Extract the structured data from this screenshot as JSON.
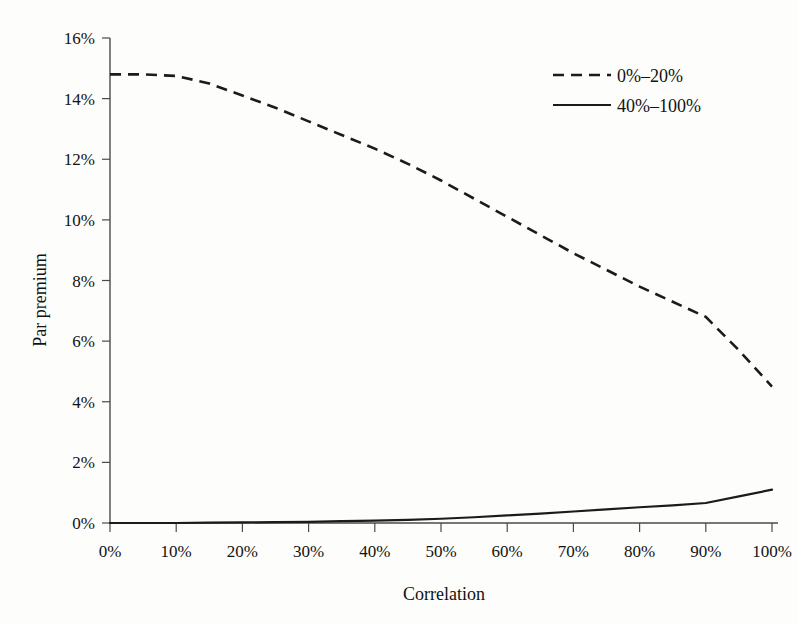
{
  "figure": {
    "background_color": "#fdfdfb",
    "ink_color": "#1b1b1b",
    "axis_color": "#4a4a4a"
  },
  "chart_data": {
    "type": "line",
    "title": "",
    "xlabel": "Correlation",
    "ylabel": "Par premium",
    "xlim": [
      0,
      100
    ],
    "ylim": [
      0,
      16
    ],
    "grid": false,
    "legend_position": "top-right",
    "x_tick_labels": [
      "0%",
      "10%",
      "20%",
      "30%",
      "40%",
      "50%",
      "60%",
      "70%",
      "80%",
      "90%",
      "100%"
    ],
    "x_tick_values": [
      0,
      10,
      20,
      30,
      40,
      50,
      60,
      70,
      80,
      90,
      100
    ],
    "y_tick_labels": [
      "0%",
      "2%",
      "4%",
      "6%",
      "8%",
      "10%",
      "12%",
      "14%",
      "16%"
    ],
    "y_tick_values": [
      0,
      2,
      4,
      6,
      8,
      10,
      12,
      14,
      16
    ],
    "x": [
      0,
      5,
      10,
      15,
      20,
      25,
      30,
      35,
      40,
      45,
      50,
      55,
      60,
      65,
      70,
      75,
      80,
      85,
      90,
      95,
      100
    ],
    "series": [
      {
        "name": "0%–20%",
        "style": "dashed",
        "color": "#1b1b1b",
        "values": [
          14.8,
          14.8,
          14.75,
          14.5,
          14.1,
          13.7,
          13.25,
          12.8,
          12.35,
          11.85,
          11.3,
          10.7,
          10.1,
          9.5,
          8.9,
          8.35,
          7.8,
          7.3,
          6.8,
          5.7,
          4.5
        ]
      },
      {
        "name": "40%–100%",
        "style": "solid",
        "color": "#1b1b1b",
        "values": [
          0.0,
          0.0,
          0.0,
          0.01,
          0.02,
          0.03,
          0.04,
          0.06,
          0.08,
          0.1,
          0.14,
          0.19,
          0.25,
          0.31,
          0.38,
          0.45,
          0.52,
          0.58,
          0.66,
          0.88,
          1.1
        ]
      }
    ]
  },
  "legend": {
    "entries": [
      {
        "label": "0%–20%",
        "style": "dashed"
      },
      {
        "label": "40%–100%",
        "style": "solid"
      }
    ]
  }
}
